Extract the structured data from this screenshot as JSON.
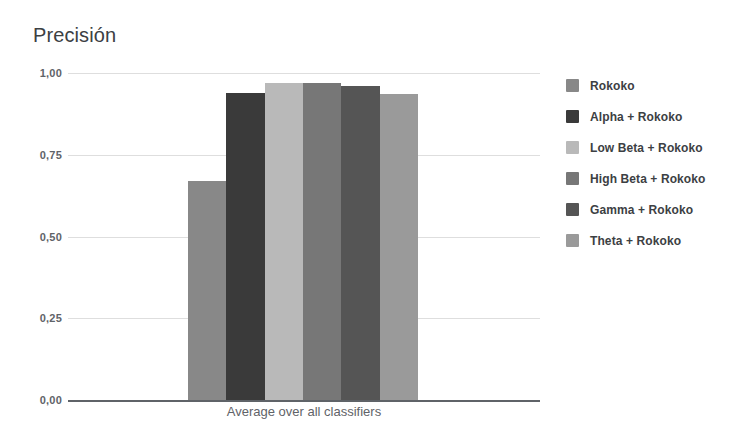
{
  "chart_data": {
    "type": "bar",
    "title": "Precisión",
    "xlabel": "Average over all classifiers",
    "ylabel": "",
    "ylim": [
      0,
      1
    ],
    "grid": true,
    "legend_position": "right",
    "categories": [
      "Average over all classifiers"
    ],
    "ytick_labels": [
      "1,00",
      "0,75",
      "0,50",
      "0,25",
      "0,00"
    ],
    "ytick_values": [
      1.0,
      0.75,
      0.5,
      0.25,
      0.0
    ],
    "series": [
      {
        "name": "Rokoko",
        "values": [
          0.67
        ],
        "color": "#888888"
      },
      {
        "name": "Alpha + Rokoko",
        "values": [
          0.94
        ],
        "color": "#3a3a3a"
      },
      {
        "name": "Low Beta + Rokoko",
        "values": [
          0.97
        ],
        "color": "#b9b9b9"
      },
      {
        "name": "High Beta + Rokoko",
        "values": [
          0.97
        ],
        "color": "#777777"
      },
      {
        "name": "Gamma + Rokoko",
        "values": [
          0.96
        ],
        "color": "#555555"
      },
      {
        "name": "Theta + Rokoko",
        "values": [
          0.935
        ],
        "color": "#9a9a9a"
      }
    ]
  },
  "colors": {
    "background": "#ffffff",
    "text": "#3c4043",
    "muted_text": "#5f6368",
    "gridline": "#dedede",
    "axis": "#5f6368"
  }
}
